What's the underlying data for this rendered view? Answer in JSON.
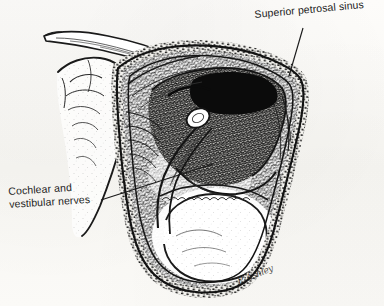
{
  "figure": {
    "kind": "anatomical-line-drawing",
    "medium": "pen-and-ink stipple and cross-hatch",
    "background_color": "#fbfaf8",
    "ink_color": "#1a1a1a",
    "canvas": {
      "width": 384,
      "height": 306
    }
  },
  "labels": {
    "superior_petrosal_sinus": "Superior petrosal sinus",
    "cochlear_vestibular_nerves_line1": "Cochlear and",
    "cochlear_vestibular_nerves_line2": "vestibular nerves"
  },
  "signature": {
    "text": "P. Ashley"
  },
  "leader_lines": [
    {
      "name": "leader-superior-petrosal-sinus",
      "from": [
        303,
        28
      ],
      "to": [
        289,
        76
      ]
    },
    {
      "name": "leader-cochlear-vestibular-nerves",
      "from": [
        101,
        200
      ],
      "to": [
        213,
        164
      ]
    }
  ]
}
